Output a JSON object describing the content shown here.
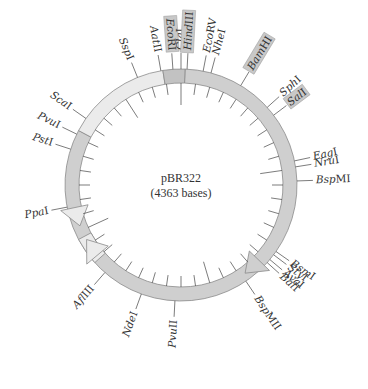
{
  "plasmid": {
    "name": "pBR322",
    "size_label": "(4363 bases)",
    "total_bases": 4363
  },
  "colors": {
    "ring_dark": "#cfcfcf",
    "ring_light": "#ebebeb",
    "origin_block": "#c2c2c2",
    "highlight_box": "#c8c8c8",
    "stroke": "#8a8a8a",
    "tick": "#444444",
    "text": "#333333"
  },
  "segments": [
    {
      "name": "amp-resistance-gene",
      "from_deg": -62,
      "to_deg": -9,
      "shade": "light",
      "arrow_at_deg": -101
    },
    {
      "name": "ori-block",
      "from_deg": -9,
      "to_deg": 2,
      "shade": "origin"
    },
    {
      "name": "tet-resistance-gene",
      "from_deg": 2,
      "to_deg": 142,
      "shade": "dark",
      "arrow_at_deg": 142
    },
    {
      "name": "rop-region",
      "from_deg": 142,
      "to_deg": 242,
      "shade": "dark"
    },
    {
      "name": "rop-gene",
      "from_deg": 242,
      "to_deg": 258,
      "shade": "light",
      "arrow_at_deg": 236
    }
  ],
  "sites": [
    {
      "name": "SspI",
      "italic_part": "Ssp",
      "suffix": "I",
      "angle": -22,
      "highlight": false
    },
    {
      "name": "AatII",
      "italic_part": "Aat",
      "suffix": "II",
      "angle": -10,
      "highlight": false
    },
    {
      "name": "EcoRI",
      "italic_part": "Eco",
      "suffix": "RI",
      "angle": -4,
      "highlight": true
    },
    {
      "name": "ClaI",
      "italic_part": "Cla",
      "suffix": "I",
      "angle": 0,
      "highlight": false
    },
    {
      "name": "HindIII",
      "italic_part": "Hind",
      "suffix": "III",
      "angle": 3,
      "highlight": true
    },
    {
      "name": "EcoRV",
      "italic_part": "Eco",
      "suffix": "RV",
      "angle": 11,
      "highlight": false
    },
    {
      "name": "NheI",
      "italic_part": "Nhe",
      "suffix": "I",
      "angle": 15,
      "highlight": false
    },
    {
      "name": "BamHI",
      "italic_part": "Bam",
      "suffix": "HI",
      "angle": 31,
      "highlight": true
    },
    {
      "name": "SphI",
      "italic_part": "Sph",
      "suffix": "I",
      "angle": 48,
      "highlight": false
    },
    {
      "name": "SalI",
      "italic_part": "Sal",
      "suffix": "I",
      "angle": 53,
      "highlight": true
    },
    {
      "name": "EagI",
      "italic_part": "Eag",
      "suffix": "I",
      "angle": 78,
      "highlight": false
    },
    {
      "name": "NruI",
      "italic_part": "Nru",
      "suffix": "I",
      "angle": 81,
      "highlight": false
    },
    {
      "name": "BspMI",
      "italic_part": "Bsp",
      "suffix": "MI",
      "angle": 88,
      "highlight": false
    },
    {
      "name": "BsmI",
      "italic_part": "Bsm",
      "suffix": "I",
      "angle": 125,
      "highlight": false
    },
    {
      "name": "StyI",
      "italic_part": "Sty",
      "suffix": "I",
      "angle": 127,
      "highlight": false
    },
    {
      "name": "AvaI",
      "italic_part": "Ava",
      "suffix": "I",
      "angle": 130,
      "highlight": false
    },
    {
      "name": "BalI",
      "italic_part": "Bal",
      "suffix": "I",
      "angle": 132,
      "highlight": false
    },
    {
      "name": "BspMII",
      "italic_part": "Bsp",
      "suffix": "MII",
      "angle": 146,
      "highlight": false
    },
    {
      "name": "PvuII",
      "italic_part": "Pvu",
      "suffix": "II",
      "angle": 183,
      "highlight": false
    },
    {
      "name": "NdeI",
      "italic_part": "Nde",
      "suffix": "I",
      "angle": 200,
      "highlight": false
    },
    {
      "name": "AflIII",
      "italic_part": "Afl",
      "suffix": "III",
      "angle": 221,
      "highlight": false
    },
    {
      "name": "PpaI",
      "italic_part": "Ppa",
      "suffix": "I",
      "angle": -101,
      "highlight": false
    },
    {
      "name": "PstI",
      "italic_part": "Pst",
      "suffix": "I",
      "angle": -72,
      "highlight": false
    },
    {
      "name": "PvuI",
      "italic_part": "Pvu",
      "suffix": "I",
      "angle": -64,
      "highlight": false
    },
    {
      "name": "ScaI",
      "italic_part": "Sca",
      "suffix": "I",
      "angle": -55,
      "highlight": false
    }
  ],
  "ticks": {
    "count": 44,
    "major_every": 10
  }
}
